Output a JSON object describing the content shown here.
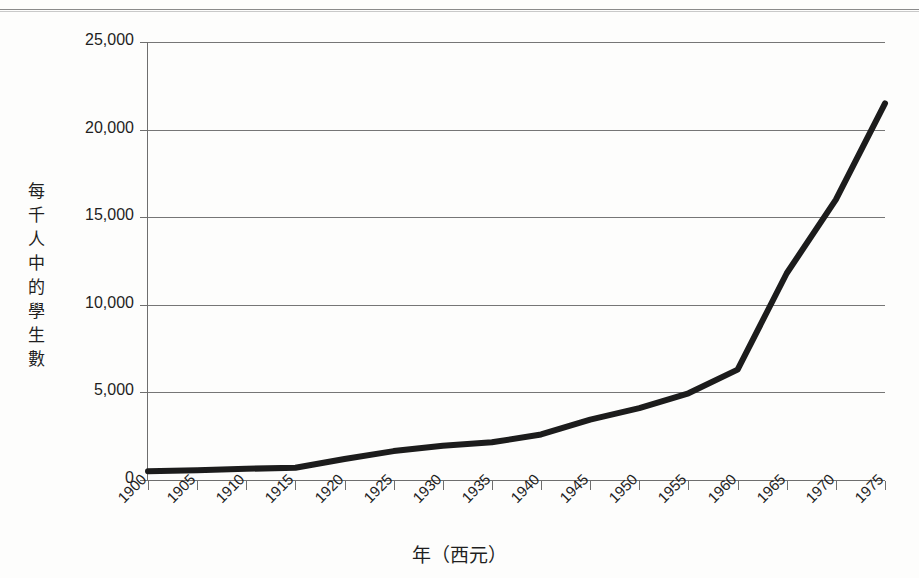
{
  "page": {
    "background_color": "#fdfdfc",
    "clipped_header_text": ""
  },
  "chart_data": {
    "type": "line",
    "title": "",
    "subtitle": "",
    "xlabel": "年（西元）",
    "ylabel": "每千人中的學生數",
    "ylabel_chars": [
      "每",
      "千",
      "人",
      "中",
      "的",
      "學",
      "生",
      "數"
    ],
    "x": [
      1900,
      1905,
      1910,
      1915,
      1920,
      1925,
      1930,
      1935,
      1940,
      1945,
      1950,
      1955,
      1960,
      1965,
      1970,
      1975
    ],
    "categories": [
      "1900",
      "1905",
      "1910",
      "1915",
      "1920",
      "1925",
      "1930",
      "1935",
      "1940",
      "1945",
      "1950",
      "1955",
      "1960",
      "1965",
      "1970",
      "1975"
    ],
    "values": [
      500,
      560,
      640,
      700,
      1200,
      1650,
      1950,
      2150,
      2600,
      3450,
      4100,
      4950,
      6300,
      11800,
      16000,
      21500
    ],
    "series": [
      {
        "name": "每千人中的學生數",
        "values": [
          500,
          560,
          640,
          700,
          1200,
          1650,
          1950,
          2150,
          2600,
          3450,
          4100,
          4950,
          6300,
          11800,
          16000,
          21500
        ],
        "color": "#1c1c1c",
        "line_width": 6
      }
    ],
    "ylim": [
      0,
      25000
    ],
    "xlim": [
      1900,
      1975
    ],
    "ytick_labels": [
      "0",
      "5,000",
      "10,000",
      "15,000",
      "20,000",
      "25,000"
    ],
    "ytick_values": [
      0,
      5000,
      10000,
      15000,
      20000,
      25000
    ],
    "grid": true,
    "grid_axis": "y",
    "grid_color": "#767676",
    "legend": false,
    "legend_position": "none",
    "axis_color": "#6e6e6e",
    "xtick_rotation": -45
  }
}
